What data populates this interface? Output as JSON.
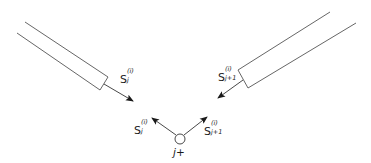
{
  "diagram": {
    "type": "vector-junction-schematic",
    "colors": {
      "stroke": "#555555",
      "arrow": "#1a1a1a",
      "text": "#1a1a1a",
      "background": "#ffffff"
    },
    "tubes": [
      {
        "id": "left-tube",
        "label": {
          "base": "S",
          "sub": "j",
          "sup": "(i)"
        }
      },
      {
        "id": "right-tube",
        "label": {
          "base": "S",
          "sub": "j+1",
          "sup": "(i)"
        }
      }
    ],
    "junction": {
      "label": "j+"
    },
    "inner_vectors": [
      {
        "id": "inner-left",
        "label": {
          "base": "S",
          "sub": "j",
          "sup": "(i)"
        }
      },
      {
        "id": "inner-right",
        "label": {
          "base": "S",
          "sub": "j+1",
          "sup": "(i)"
        }
      }
    ]
  }
}
